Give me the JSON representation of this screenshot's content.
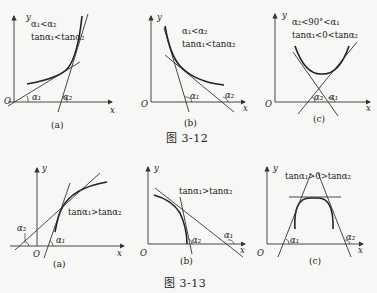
{
  "figure_3_12": {
    "caption": "图   3-12",
    "panels": [
      {
        "id": "a",
        "label": "(a)",
        "ann1": "α₁<α₂",
        "ann2": "tanα₁<tanα₂",
        "alpha1": "α₁",
        "alpha2": "α₂",
        "origin": "O",
        "x": "x",
        "y": "y"
      },
      {
        "id": "b",
        "label": "(b)",
        "ann1": "α₁<α₂",
        "ann2": "tanα₁<tanα₂",
        "alpha1": "α₁",
        "alpha2": "α₂",
        "origin": "O",
        "x": "x",
        "y": "y"
      },
      {
        "id": "c",
        "label": "(c)",
        "ann1": "α₂<90°<α₁",
        "ann2": "tanα₁<0<tanα₂",
        "alpha1": "α₁",
        "alpha2": "α₂",
        "origin": "O",
        "x": "x",
        "y": "y"
      }
    ]
  },
  "figure_3_13": {
    "caption": "图   3-13",
    "panels": [
      {
        "id": "a",
        "label": "(a)",
        "ann1": "tanα₁>tanα₂",
        "alpha1": "α₁",
        "alpha2": "α₂",
        "origin": "O",
        "x": "x",
        "y": "y"
      },
      {
        "id": "b",
        "label": "(b)",
        "ann1": "tanα₁>tanα₂",
        "alpha1": "α₁",
        "alpha2": "α₂",
        "origin": "O",
        "x": "x",
        "y": "y"
      },
      {
        "id": "c",
        "label": "(c)",
        "ann1": "tanα₁>0>tanα₂",
        "alpha1": "α₁",
        "alpha2": "α₂",
        "origin": "O",
        "x": "x",
        "y": "y"
      }
    ]
  }
}
